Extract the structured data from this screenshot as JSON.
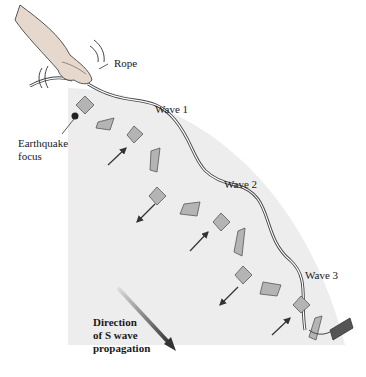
{
  "labels": {
    "rope": "Rope",
    "wave1": "Wave 1",
    "wave2": "Wave 2",
    "wave3": "Wave 3",
    "focus_line1": "Earthquake",
    "focus_line2": "focus",
    "direction_line1": "Direction",
    "direction_line2": "of S wave",
    "direction_line3": "propagation"
  },
  "colors": {
    "background": "#ffffff",
    "region": "#ededed",
    "square_fill": "#b4b4b4",
    "square_stroke": "#555555",
    "arrow": "#333333",
    "rope": "#444444"
  },
  "icons": {
    "hand": "hand-icon",
    "motion_lines": "vibration-lines-icon",
    "anchor": "rope-anchor-icon"
  }
}
